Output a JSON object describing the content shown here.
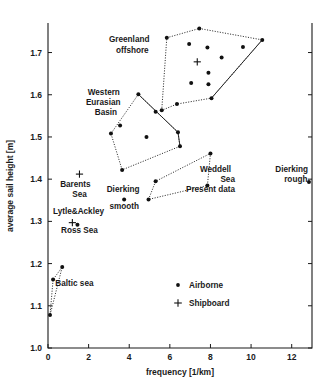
{
  "chart_data": {
    "type": "scatter",
    "title": "",
    "xlabel": "frequency [1/km]",
    "ylabel": "average sail height [m]",
    "xlim": [
      0,
      13
    ],
    "ylim": [
      1.0,
      1.77
    ],
    "xticks": [
      0,
      2,
      4,
      6,
      8,
      10,
      12
    ],
    "xticklabels": [
      "0",
      "2",
      "4",
      "6",
      "8",
      "10",
      "12"
    ],
    "yticks": [
      1.0,
      1.1,
      1.2,
      1.3,
      1.4,
      1.5,
      1.6,
      1.7
    ],
    "yticklabels": [
      "1.0",
      "1.1",
      "1.2",
      "1.3",
      "1.4",
      "1.5",
      "1.6",
      "1.7"
    ],
    "grid": false,
    "legend_position": "lower-center-right",
    "legend": [
      {
        "label": "Airborne",
        "marker": "filled-circle"
      },
      {
        "label": "Shipboard",
        "marker": "plus"
      }
    ],
    "annotations": [
      {
        "text": "Greenland",
        "x": 4.0,
        "y": 1.725
      },
      {
        "text": "offshore",
        "x": 4.15,
        "y": 1.7
      },
      {
        "text": "Western",
        "x": 2.75,
        "y": 1.6
      },
      {
        "text": "Eurasian",
        "x": 2.72,
        "y": 1.575
      },
      {
        "text": "Basin",
        "x": 2.85,
        "y": 1.551
      },
      {
        "text": "Weddell",
        "x": 8.25,
        "y": 1.418
      },
      {
        "text": "Sea",
        "x": 8.85,
        "y": 1.394
      },
      {
        "text": "Present data",
        "x": 8.0,
        "y": 1.37
      },
      {
        "text": "Dierking",
        "x": 12.0,
        "y": 1.418
      },
      {
        "text": "rough",
        "x": 12.2,
        "y": 1.394
      },
      {
        "text": "Barents",
        "x": 1.35,
        "y": 1.382
      },
      {
        "text": "Sea",
        "x": 1.55,
        "y": 1.358
      },
      {
        "text": "Dierking",
        "x": 3.7,
        "y": 1.37
      },
      {
        "text": "smooth",
        "x": 3.75,
        "y": 1.33
      },
      {
        "text": "Lytle&Ackley",
        "x": 1.5,
        "y": 1.318
      },
      {
        "text": "Ross Sea",
        "x": 1.55,
        "y": 1.272
      },
      {
        "text": "Baltic sea",
        "x": 1.3,
        "y": 1.148
      }
    ],
    "series": [
      {
        "name": "Greenland offshore",
        "marker": "filled-circle",
        "hull_style": "dotted",
        "hull": [
          [
            5.6,
            1.563
          ],
          [
            5.85,
            1.735
          ],
          [
            7.45,
            1.757
          ],
          [
            10.55,
            1.73
          ],
          [
            8.05,
            1.592
          ],
          [
            6.35,
            1.578
          ]
        ],
        "points": [
          [
            6.95,
            1.72
          ],
          [
            7.85,
            1.712
          ],
          [
            9.6,
            1.713
          ],
          [
            8.55,
            1.688
          ],
          [
            7.9,
            1.652
          ],
          [
            7.05,
            1.628
          ],
          [
            7.9,
            1.625
          ],
          [
            8.05,
            1.592
          ],
          [
            6.35,
            1.578
          ],
          [
            5.85,
            1.735
          ],
          [
            7.45,
            1.757
          ],
          [
            10.55,
            1.73
          ],
          [
            5.6,
            1.563
          ]
        ],
        "shipboard_points": [
          [
            7.35,
            1.678
          ]
        ]
      },
      {
        "name": "Western Eurasian Basin",
        "marker": "filled-circle",
        "hull_style": "solid",
        "hull": [
          [
            3.1,
            1.508
          ],
          [
            4.45,
            1.601
          ],
          [
            6.4,
            1.511
          ],
          [
            6.5,
            1.478
          ],
          [
            3.65,
            1.422
          ]
        ],
        "points": [
          [
            3.1,
            1.508
          ],
          [
            4.45,
            1.601
          ],
          [
            5.3,
            1.56
          ],
          [
            6.4,
            1.511
          ],
          [
            6.5,
            1.478
          ],
          [
            3.65,
            1.422
          ],
          [
            3.55,
            1.527
          ],
          [
            4.85,
            1.5
          ]
        ],
        "shipboard_points": []
      },
      {
        "name": "Weddell Sea Present data",
        "marker": "filled-circle",
        "hull_style": "dotted",
        "hull": [
          [
            4.95,
            1.352
          ],
          [
            5.3,
            1.395
          ],
          [
            8.0,
            1.461
          ],
          [
            7.85,
            1.385
          ]
        ],
        "points": [
          [
            4.95,
            1.352
          ],
          [
            5.3,
            1.395
          ],
          [
            8.0,
            1.461
          ],
          [
            7.85,
            1.385
          ]
        ],
        "shipboard_points": []
      },
      {
        "name": "Baltic sea",
        "marker": "filled-circle",
        "hull_style": "dotted",
        "hull": [
          [
            0.1,
            1.078
          ],
          [
            0.25,
            1.162
          ],
          [
            0.7,
            1.192
          ]
        ],
        "points": [
          [
            0.1,
            1.078
          ],
          [
            0.25,
            1.162
          ],
          [
            0.7,
            1.192
          ]
        ],
        "shipboard_points": []
      },
      {
        "name": "Dierking smooth",
        "marker": "filled-circle",
        "hull_style": "none",
        "hull": [],
        "points": [
          [
            3.75,
            1.352
          ]
        ],
        "shipboard_points": []
      },
      {
        "name": "Dierking rough",
        "marker": "filled-circle",
        "hull_style": "none",
        "hull": [],
        "points": [
          [
            12.85,
            1.393
          ]
        ],
        "shipboard_points": []
      },
      {
        "name": "Lytle&Ackley Ross Sea",
        "marker": "plus",
        "hull_style": "none",
        "hull": [],
        "points": [
          [
            1.45,
            1.292
          ]
        ],
        "shipboard_points": [
          [
            1.2,
            1.297
          ]
        ]
      },
      {
        "name": "Barents Sea",
        "marker": "plus",
        "hull_style": "none",
        "hull": [],
        "points": [],
        "shipboard_points": [
          [
            1.55,
            1.412
          ]
        ]
      }
    ]
  },
  "legend_items": {
    "airborne": "Airborne",
    "shipboard": "Shipboard"
  },
  "axes": {
    "x_title": "frequency [1/km]",
    "y_title": "average sail height [m]"
  }
}
